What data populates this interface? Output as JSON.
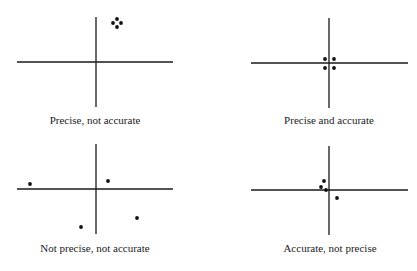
{
  "diagram": {
    "line_color": "#1a1a1a",
    "dot_color": "#111111",
    "panels": [
      {
        "id": "precise-not-accurate",
        "caption": "Precise, not accurate",
        "axes": {
          "cx": 96,
          "cy": 62,
          "x0": 17,
          "x1": 173,
          "y0": 17,
          "y1": 107
        },
        "caption_pos": {
          "x": 95,
          "y": 121
        },
        "points": [
          [
            117,
            19
          ],
          [
            113,
            23
          ],
          [
            121,
            23
          ],
          [
            117,
            27
          ]
        ]
      },
      {
        "id": "precise-and-accurate",
        "caption": "Precise and accurate",
        "axes": {
          "cx": 329,
          "cy": 63,
          "x0": 251,
          "x1": 408,
          "y0": 18,
          "y1": 108
        },
        "caption_pos": {
          "x": 329,
          "y": 121
        },
        "points": [
          [
            325,
            59
          ],
          [
            334,
            59
          ],
          [
            325,
            68
          ],
          [
            334,
            68
          ]
        ]
      },
      {
        "id": "not-precise-not-accurate",
        "caption": "Not precise, not accurate",
        "axes": {
          "cx": 96,
          "cy": 189,
          "x0": 17,
          "x1": 173,
          "y0": 144,
          "y1": 234
        },
        "caption_pos": {
          "x": 95,
          "y": 249
        },
        "points": [
          [
            30,
            184
          ],
          [
            108,
            181
          ],
          [
            81,
            227
          ],
          [
            137,
            218
          ]
        ]
      },
      {
        "id": "accurate-not-precise",
        "caption": "Accurate, not precise",
        "axes": {
          "cx": 329,
          "cy": 190,
          "x0": 251,
          "x1": 408,
          "y0": 146,
          "y1": 235
        },
        "caption_pos": {
          "x": 330,
          "y": 249
        },
        "points": [
          [
            324,
            181
          ],
          [
            321,
            187
          ],
          [
            326,
            190
          ],
          [
            337,
            198
          ]
        ]
      }
    ]
  }
}
